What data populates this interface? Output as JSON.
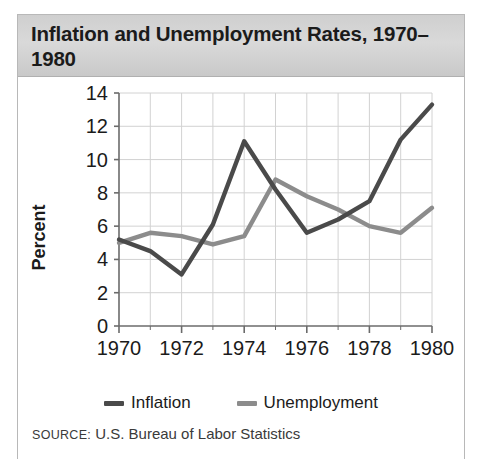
{
  "figure": {
    "title": "Inflation and Unemployment Rates, 1970–1980",
    "source_label": "SOURCE:",
    "source_text": "U.S. Bureau of Labor Statistics"
  },
  "legend": {
    "position": "bottom-center",
    "entries": [
      {
        "label": "Inflation",
        "color": "#4a4a4a",
        "icon": "line-swatch"
      },
      {
        "label": "Unemployment",
        "color": "#8c8c8c",
        "icon": "line-swatch"
      }
    ]
  },
  "chart_data": {
    "type": "line",
    "title": "Inflation and Unemployment Rates, 1970–1980",
    "xlabel": "",
    "ylabel": "Percent",
    "x": [
      1970,
      1971,
      1972,
      1973,
      1974,
      1975,
      1976,
      1977,
      1978,
      1979,
      1980
    ],
    "xlim": [
      1970,
      1980
    ],
    "ylim": [
      0,
      14
    ],
    "ytick_step": 2,
    "yticks": [
      0,
      2,
      4,
      6,
      8,
      10,
      12,
      14
    ],
    "ytick_labels": [
      "0",
      "2",
      "4",
      "6",
      "8",
      "10",
      "12",
      "14"
    ],
    "xticks": [
      1970,
      1972,
      1974,
      1976,
      1978,
      1980
    ],
    "xtick_labels": [
      "1970",
      "1972",
      "1974",
      "1976",
      "1978",
      "1980"
    ],
    "xminor_ticks": [
      1971,
      1973,
      1975,
      1977,
      1979
    ],
    "grid": true,
    "series": [
      {
        "name": "Inflation",
        "color": "#4a4a4a",
        "values": [
          5.2,
          4.5,
          3.1,
          6.1,
          11.1,
          8.2,
          5.6,
          6.4,
          7.5,
          11.2,
          13.3
        ]
      },
      {
        "name": "Unemployment",
        "color": "#8c8c8c",
        "values": [
          5.0,
          5.6,
          5.4,
          4.9,
          5.4,
          8.8,
          7.8,
          7.0,
          6.0,
          5.6,
          7.1
        ]
      }
    ]
  }
}
